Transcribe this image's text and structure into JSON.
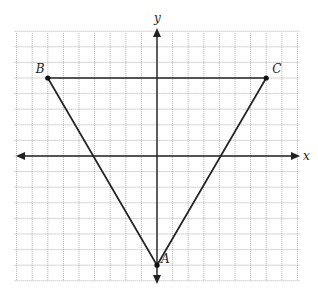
{
  "diagram": {
    "type": "coordinate-plane-triangle",
    "axes": {
      "x_label": "x",
      "y_label": "y"
    },
    "grid": {
      "x_range": [
        -9,
        9
      ],
      "y_range": [
        -8,
        8
      ],
      "step": 1
    },
    "points": [
      {
        "name": "B",
        "x": -7,
        "y": 5
      },
      {
        "name": "C",
        "x": 7,
        "y": 5
      },
      {
        "name": "A",
        "x": 0,
        "y": -7
      }
    ],
    "segments": [
      [
        "B",
        "C"
      ],
      [
        "B",
        "A"
      ],
      [
        "C",
        "A"
      ]
    ],
    "colors": {
      "line": "#222222",
      "grid": "#9a9a9a"
    }
  }
}
